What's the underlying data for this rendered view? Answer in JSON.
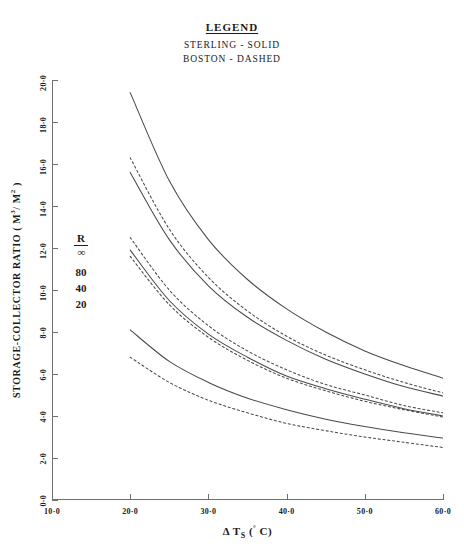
{
  "legend": {
    "title": "LEGEND",
    "lines": [
      "STERLING - SOLID",
      "BOSTON - DASHED"
    ]
  },
  "axes": {
    "ytitle": "STORAGE-COLLECTOR RATIO ( M",
    "ytitle_sup1": "3",
    "ytitle_mid": "/ M",
    "ytitle_sup2": "2",
    "ytitle_end": " )",
    "xtitle_delta": "Δ",
    "xtitle_t": " T",
    "xtitle_sub": "S",
    "xtitle_unit": " (",
    "xtitle_deg": "°",
    "xtitle_c": " C)",
    "yticks": [
      "0·0",
      "2·0",
      "4·0",
      "6·0",
      "8·0",
      "10·0",
      "12·0",
      "14·0",
      "16·0",
      "18·0",
      "20·0"
    ],
    "xticks": [
      "10·0",
      "20·0",
      "30·0",
      "40·0",
      "50·0",
      "60·0"
    ]
  },
  "curve_key": {
    "numerator": "R",
    "denominator": "∞",
    "values": [
      "80",
      "40",
      "20"
    ]
  },
  "chart_data": {
    "type": "line",
    "title": "",
    "xlabel": "Δ Ts (° C)",
    "ylabel": "STORAGE-COLLECTOR RATIO ( M3 / M2 )",
    "xlim": [
      10.0,
      60.0
    ],
    "ylim": [
      0.0,
      20.0
    ],
    "xtick_values": [
      10.0,
      20.0,
      30.0,
      40.0,
      50.0,
      60.0
    ],
    "ytick_values": [
      0.0,
      2.0,
      4.0,
      6.0,
      8.0,
      10.0,
      12.0,
      14.0,
      16.0,
      18.0,
      20.0
    ],
    "grid": false,
    "legend_position": "above-plot",
    "legend_entries": [
      {
        "name": "STERLING",
        "style": "solid"
      },
      {
        "name": "BOSTON",
        "style": "dashed"
      }
    ],
    "x": [
      20,
      25,
      30,
      35,
      40,
      45,
      50,
      55,
      60
    ],
    "series": [
      {
        "name": "STERLING R/∞",
        "style": "solid",
        "label": "∞",
        "values": [
          19.4,
          15.2,
          12.4,
          10.5,
          9.1,
          8.0,
          7.1,
          6.4,
          5.8
        ]
      },
      {
        "name": "BOSTON R/∞",
        "style": "dashed",
        "label": "∞",
        "values": [
          16.3,
          12.9,
          10.6,
          9.0,
          7.8,
          6.9,
          6.2,
          5.6,
          5.1
        ]
      },
      {
        "name": "STERLING R/80",
        "style": "solid",
        "label": "80",
        "values": [
          15.6,
          12.4,
          10.2,
          8.7,
          7.6,
          6.7,
          6.0,
          5.4,
          4.95
        ]
      },
      {
        "name": "BOSTON R/80",
        "style": "dashed",
        "label": "80",
        "values": [
          12.5,
          10.0,
          8.3,
          7.1,
          6.2,
          5.5,
          5.0,
          4.5,
          4.15
        ]
      },
      {
        "name": "STERLING R/40",
        "style": "solid",
        "label": "40",
        "values": [
          11.9,
          9.5,
          7.9,
          6.8,
          5.9,
          5.3,
          4.8,
          4.35,
          4.0
        ]
      },
      {
        "name": "BOSTON R/40",
        "style": "dashed",
        "label": "40",
        "values": [
          11.6,
          9.3,
          7.75,
          6.65,
          5.8,
          5.2,
          4.7,
          4.3,
          3.95
        ]
      },
      {
        "name": "STERLING R/20",
        "style": "solid",
        "label": "20",
        "values": [
          8.1,
          6.6,
          5.6,
          4.85,
          4.3,
          3.85,
          3.5,
          3.2,
          2.95
        ]
      },
      {
        "name": "BOSTON R/20",
        "style": "dashed",
        "label": "20",
        "values": [
          6.8,
          5.6,
          4.75,
          4.15,
          3.65,
          3.3,
          3.0,
          2.75,
          2.5
        ]
      }
    ]
  },
  "style": {
    "line_color": "#4a4a4a",
    "axis_color": "#6f6f6f",
    "text_color": "#1a1a1a",
    "background": "#ffffff"
  }
}
